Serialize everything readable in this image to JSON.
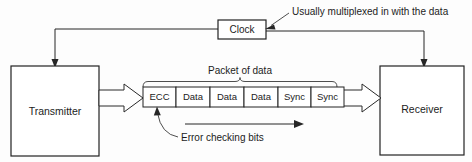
{
  "diagram": {
    "background_color": "#fdfdfd",
    "line_color": "#262626",
    "text_color": "#1c1c1c"
  },
  "blocks": {
    "transmitter": {
      "label": "Transmitter"
    },
    "receiver": {
      "label": "Receiver"
    },
    "clock": {
      "label": "Clock"
    }
  },
  "packet": {
    "caption": "Packet of  data",
    "cells": [
      {
        "label": "ECC"
      },
      {
        "label": "Data"
      },
      {
        "label": "Data"
      },
      {
        "label": "Data"
      },
      {
        "label": "Sync"
      },
      {
        "label": "Sync"
      }
    ]
  },
  "annotations": {
    "clock_note": "Usually multiplexed in with the data",
    "ecc_note": "Error checking bits"
  }
}
